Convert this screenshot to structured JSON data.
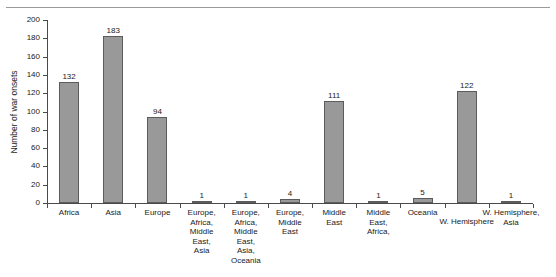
{
  "figure": {
    "top_rule": true,
    "bar_color": "#999999",
    "bar_edge_color": "#5c5c5c",
    "axis_color": "#4a4a4a",
    "background": "#ffffff"
  },
  "chart_data": {
    "type": "bar",
    "title": "",
    "xlabel": "",
    "ylabel": "Number of war onsets",
    "ylim": [
      0,
      200
    ],
    "grid": false,
    "legend": "none",
    "ytick_labels": [
      "200",
      "180",
      "160",
      "140",
      "120",
      "100",
      "80",
      "60",
      "40",
      "20",
      "0"
    ],
    "yticks": [
      200,
      180,
      160,
      140,
      120,
      100,
      80,
      60,
      40,
      20,
      0
    ],
    "categories": [
      "Africa",
      "Asia",
      "Europe",
      "Europe,\nAfrica,\nMiddle\nEast,\nAsia",
      "Europe,\nAfrica,\nMiddle\nEast,\nAsia,\nOceania",
      "Europe,\nMiddle\nEast",
      "Middle\nEast",
      "Middle\nEast,\nAfrica,",
      "Oceania",
      "W. Hemisphere",
      "W. Hemisphere,\nAsia"
    ],
    "values": [
      132,
      183,
      94,
      1,
      1,
      4,
      111,
      1,
      5,
      122,
      1
    ],
    "value_labels": [
      "132",
      "183",
      "94",
      "1",
      "1",
      "4",
      "111",
      "1",
      "5",
      "122",
      "1"
    ]
  }
}
